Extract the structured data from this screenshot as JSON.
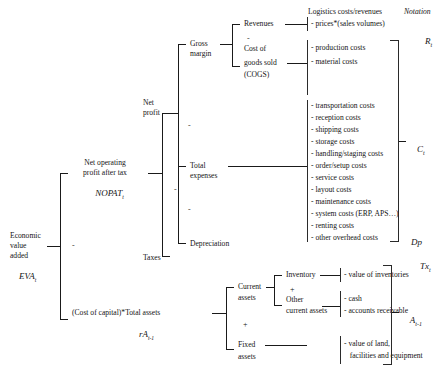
{
  "diagram": {
    "title_columns": {
      "logistics": "Logistics costs/revenues",
      "notation": "Notation"
    },
    "root": {
      "line1": "Economic",
      "line2": "value",
      "line3": "added",
      "formula": "EVA",
      "formula_sub": "t"
    },
    "level1": {
      "nopat_line1": "Net operating",
      "nopat_line2": "profit after tax",
      "nopat_formula": "NOPAT",
      "nopat_sub": "t",
      "capital_text": "(Cost of capital)*Total assets",
      "capital_formula": "rA",
      "capital_sub": "t-1",
      "operator": "-"
    },
    "level2": {
      "net_profit_line1": "Net",
      "net_profit_line2": "profit",
      "taxes": "Taxes",
      "operator": "-"
    },
    "level3": {
      "gross_margin_line1": "Gross",
      "gross_margin_line2": "margin",
      "total_expenses_line1": "Total",
      "total_expenses_line2": "expenses",
      "depreciation": "Depreciation",
      "operator": "-"
    },
    "level4": {
      "revenues": "Revenues",
      "cogs_line1": "Cost of",
      "cogs_line2": "goods sold",
      "cogs_line3": "(COGS)",
      "operator": "-"
    },
    "assets": {
      "current_line1": "Current",
      "current_line2": "assets",
      "fixed_line1": "Fixed",
      "fixed_line2": "assets",
      "operator": "+",
      "inventory": "Inventory",
      "other_line1": "Other",
      "other_line2": "current assets",
      "inventory_operator": "+"
    },
    "items": {
      "revenues": [
        "- prices*(sales volumes)"
      ],
      "cogs": [
        "- production costs",
        "- material costs"
      ],
      "expenses": [
        "- transportation costs",
        "- reception costs",
        "- shipping costs",
        "- storage costs",
        "- handling/staging costs",
        "- order/setup costs",
        "- service costs",
        "- layout costs",
        "- maintenance costs",
        "- system costs (ERP, APS…)",
        "- renting costs",
        "- other overhead costs"
      ],
      "inventory": [
        "- value of inventories"
      ],
      "other_current": [
        "- cash",
        "- accounts receivable"
      ],
      "fixed": [
        "- value of land,",
        "   facilities and equipment"
      ]
    },
    "notation": {
      "revenues": "R",
      "revenues_sub": "t",
      "costs": "C",
      "costs_sub": "t",
      "depreciation": "Dp",
      "taxes": "Tx",
      "taxes_sub": "t",
      "assets": "A",
      "assets_sub": "t-1"
    }
  }
}
